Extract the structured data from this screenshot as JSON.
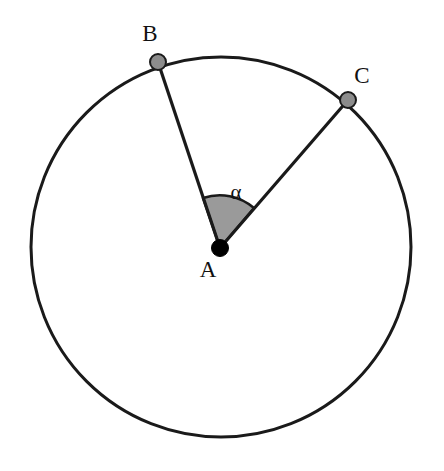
{
  "figure": {
    "canvas": {
      "width": 444,
      "height": 471,
      "background": "#ffffff"
    },
    "colors": {
      "stroke": "#1a1a1a",
      "center_dot_fill": "#000000",
      "point_dot_fill": "#8c8c8c",
      "point_dot_stroke": "#1a1a1a",
      "sector_fill": "#9a9a9a",
      "sector_stroke": "#1a1a1a",
      "baseline": "#6f6f6f"
    },
    "circle": {
      "name": "main-circle",
      "center_x": 221,
      "center_y": 247,
      "radius": 190,
      "stroke_width": 3
    },
    "points": [
      {
        "id": "A",
        "label": "A",
        "role": "center",
        "x": 220,
        "y": 248,
        "dot_radius": 8,
        "label_x": 208,
        "label_y": 269
      },
      {
        "id": "B",
        "label": "B",
        "role": "on-circle",
        "x": 158,
        "y": 62,
        "dot_radius": 8,
        "label_x": 150,
        "label_y": 33
      },
      {
        "id": "C",
        "label": "C",
        "role": "on-circle",
        "x": 348,
        "y": 100,
        "dot_radius": 8,
        "label_x": 362,
        "label_y": 75
      }
    ],
    "radii_segments": [
      {
        "name": "segment-AB",
        "from": "A",
        "to": "B",
        "x1": 220,
        "y1": 248,
        "x2": 158,
        "y2": 62
      },
      {
        "name": "segment-AC",
        "from": "A",
        "to": "C",
        "x1": 220,
        "y1": 248,
        "x2": 348,
        "y2": 100
      }
    ],
    "angle": {
      "name": "central-angle",
      "label": "α",
      "vertex": "A",
      "from_ray": "AB",
      "to_ray": "AC",
      "arc_radius": 52,
      "start_angle_deg": 49.2,
      "end_angle_deg": 108.4,
      "label_x": 236,
      "label_y": 192
    },
    "baseline": {
      "name": "bottom-rule",
      "x1": 15,
      "y1": 463,
      "x2": 440,
      "y2": 464,
      "stroke_width": 2
    }
  }
}
